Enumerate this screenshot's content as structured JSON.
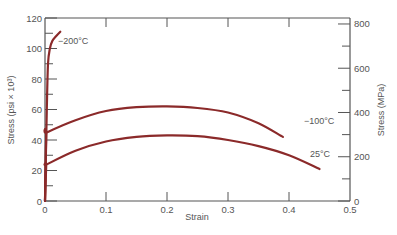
{
  "chart_data": {
    "type": "line",
    "title": "",
    "xlabel": "Strain",
    "ylabel": "Stress (psi × 10³)",
    "y2label": "Stress (MPa)",
    "xlim": [
      0,
      0.5
    ],
    "ylim": [
      0,
      120
    ],
    "y2lim": [
      0,
      827
    ],
    "xticks": [
      "0",
      "0.1",
      "0.2",
      "0.3",
      "0.4",
      "0.5"
    ],
    "yticks": [
      "0",
      "20",
      "40",
      "60",
      "80",
      "100",
      "120"
    ],
    "y2ticks": [
      "0",
      "200",
      "400",
      "600",
      "800"
    ],
    "grid": false,
    "legend": "inline labels",
    "series": [
      {
        "name": "−200°C",
        "label": "−200°C",
        "color": "#8b2a2a",
        "x": [
          0.0,
          0.003,
          0.005,
          0.008,
          0.012,
          0.018,
          0.025
        ],
        "y": [
          0,
          60,
          90,
          100,
          105,
          108,
          111
        ]
      },
      {
        "name": "−100°C",
        "label": "−100°C",
        "color": "#8b2a2a",
        "x": [
          0.0,
          0.002,
          0.003,
          0.05,
          0.1,
          0.15,
          0.2,
          0.25,
          0.3,
          0.35,
          0.39
        ],
        "y": [
          0,
          44,
          45,
          53,
          59,
          61.5,
          62,
          61,
          58,
          51,
          42
        ]
      },
      {
        "name": "25°C",
        "label": "25°C",
        "color": "#8b2a2a",
        "x": [
          0.0,
          0.002,
          0.003,
          0.05,
          0.1,
          0.15,
          0.2,
          0.25,
          0.3,
          0.35,
          0.4,
          0.45
        ],
        "y": [
          0,
          23,
          24,
          33,
          39,
          42,
          43,
          42.5,
          40,
          36,
          30,
          21
        ]
      }
    ]
  }
}
